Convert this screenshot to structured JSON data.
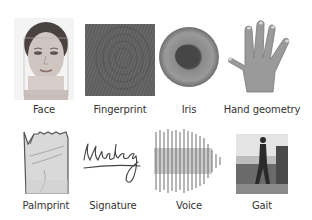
{
  "figure": {
    "rows": [
      {
        "items": [
          {
            "label": "Face",
            "icon": "face-photo"
          },
          {
            "label": "Fingerprint",
            "icon": "fingerprint-image"
          },
          {
            "label": "Iris",
            "icon": "iris-image"
          },
          {
            "label": "Hand geometry",
            "icon": "hand-image"
          }
        ]
      },
      {
        "items": [
          {
            "label": "Palmprint",
            "icon": "palmprint-image"
          },
          {
            "label": "Signature",
            "icon": "signature-image"
          },
          {
            "label": "Voice",
            "icon": "voice-waveform"
          },
          {
            "label": "Gait",
            "icon": "gait-photo"
          }
        ]
      }
    ],
    "colors": {
      "background": "#ffffff",
      "label_text": "#333333",
      "image_gray": "#777777"
    }
  }
}
